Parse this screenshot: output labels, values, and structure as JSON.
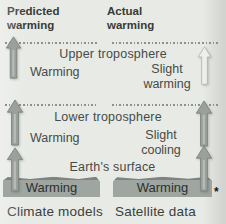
{
  "columns": {
    "predicted": {
      "heading": "Predicted warming",
      "caption": "Climate models"
    },
    "actual": {
      "heading": "Actual warming",
      "caption": "Satellite data"
    }
  },
  "layers": {
    "upper_troposphere": {
      "label": "Upper troposphere",
      "predicted_trend": "Warming",
      "actual_trend": "Slight warming"
    },
    "lower_troposphere": {
      "label": "Lower troposphere",
      "predicted_trend": "Warming",
      "actual_trend": "Slight cooling"
    },
    "surface": {
      "label": "Earth's surface",
      "predicted_trend": "Warming",
      "actual_trend": "Warming"
    }
  },
  "footnote_marker": "*",
  "icons": {
    "up_arrow": "up-arrow-icon"
  },
  "colors": {
    "background": "#e8eae6",
    "strong_warming_arrow": "#9aa09c",
    "slight_warming_arrow": "#edefeb",
    "ground": "#9fa5a1",
    "dotted_line": "#8d918d",
    "text": "#3c403c"
  }
}
